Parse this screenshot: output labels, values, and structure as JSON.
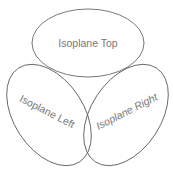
{
  "diagram": {
    "stroke_color": "#555555",
    "text_color": "#777777",
    "background": "#ffffff",
    "ellipses": [
      {
        "name": "top",
        "label": "Isoplane Top",
        "cx": 88,
        "cy": 43,
        "rx": 56,
        "ry": 34,
        "rotate": 0
      },
      {
        "name": "left",
        "label": "Isoplane Left",
        "cx": 49,
        "cy": 115,
        "rx": 56,
        "ry": 35,
        "rotate": 57
      },
      {
        "name": "right",
        "label": "Isoplane Right",
        "cx": 126,
        "cy": 115,
        "rx": 56,
        "ry": 35,
        "rotate": -57
      }
    ]
  }
}
